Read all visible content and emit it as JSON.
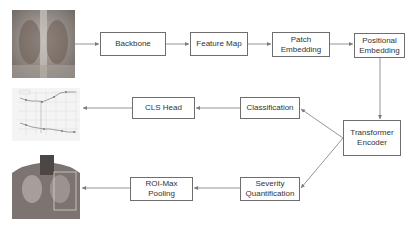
{
  "nodes": {
    "backbone": "Backbone",
    "feature_map": "Feature Map",
    "patch_embedding": [
      "Patch",
      "Embedding"
    ],
    "positional_embedding": [
      "Positional",
      "Embedding"
    ],
    "transformer_encoder": [
      "Transformer",
      "Encoder"
    ],
    "classification": "Classification",
    "cls_head": "CLS Head",
    "severity_quantification": [
      "Severity",
      "Quantification"
    ],
    "roi_max_pooling": [
      "ROI-Max",
      "Pooling"
    ]
  },
  "images": {
    "input": "chest-xray-input",
    "output_chart": "training-curve-chart",
    "output_roi": "chest-xray-roi-output"
  },
  "colors": {
    "border": "#6e6e6e",
    "arrow": "#7a7a7a",
    "text": "#333333"
  }
}
